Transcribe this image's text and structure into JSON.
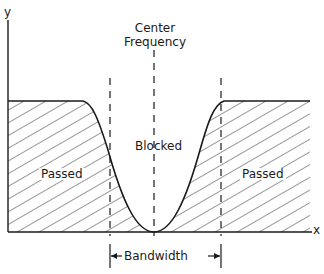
{
  "diagram": {
    "axes": {
      "x_label": "x",
      "y_label": "y"
    },
    "center_label_line1": "Center",
    "center_label_line2": "Frequency",
    "regions": {
      "left": "Passed",
      "middle": "Blocked",
      "right": "Passed"
    },
    "bandwidth_label": "Bandwidth",
    "colors": {
      "stroke": "#1a1a1a",
      "background": "#ffffff"
    }
  }
}
